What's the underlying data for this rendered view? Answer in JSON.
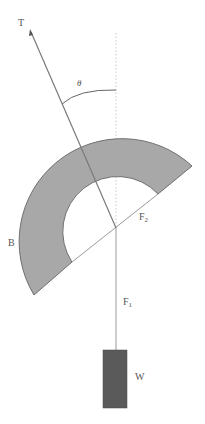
{
  "diagram": {
    "type": "physics-force-diagram",
    "labels": {
      "tension": "T",
      "angle": "θ",
      "body": "B",
      "force2": "F",
      "force2_sub": "2",
      "force1": "F",
      "force1_sub": "1",
      "weight": "W"
    },
    "colors": {
      "body_fill": "#a8a8a8",
      "body_stroke": "#6f6f6f",
      "weight_fill": "#5a5a5a",
      "line": "#8a8a8a",
      "dotted": "#c8c8c8",
      "label": "#555555"
    },
    "geometry": {
      "pivot": [
        116,
        228
      ],
      "outer_radius": 103,
      "inner_radius": 55,
      "tension_tip": [
        31,
        30
      ],
      "weight_box": {
        "x": 103,
        "y": 350,
        "w": 24,
        "h": 58
      }
    }
  }
}
